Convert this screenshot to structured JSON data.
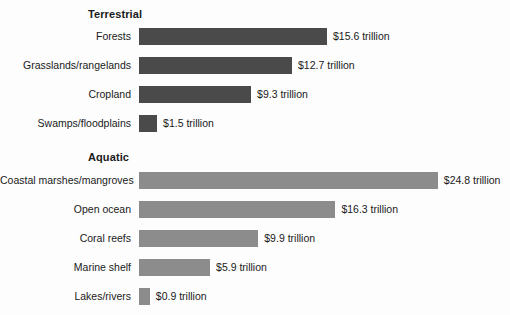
{
  "chart_data": {
    "type": "bar",
    "title": "",
    "xlabel": "",
    "ylabel": "",
    "orientation": "horizontal",
    "grid": false,
    "legend": "none",
    "value_unit": "trillion USD",
    "xlim": [
      0,
      24.8
    ],
    "groups": [
      {
        "name": "terrestrial",
        "header": "Terrestrial",
        "bar_color": "#4a4a4a",
        "categories": [
          "Forests",
          "Grasslands/rangelands",
          "Cropland",
          "Swamps/floodplains"
        ],
        "values": [
          15.6,
          12.7,
          9.3,
          1.5
        ],
        "value_labels": [
          "$15.6 trillion",
          "$12.7 trillion",
          "$9.3 trillion",
          "$1.5 trillion"
        ]
      },
      {
        "name": "aquatic",
        "header": "Aquatic",
        "bar_color": "#8c8c8c",
        "categories": [
          "Coastal marshes/mangroves",
          "Open ocean",
          "Coral reefs",
          "Marine shelf",
          "Lakes/rivers"
        ],
        "values": [
          24.8,
          16.3,
          9.9,
          5.9,
          0.9
        ],
        "value_labels": [
          "$24.8 trillion",
          "$16.3 trillion",
          "$9.9 trillion",
          "$5.9 trillion",
          "$0.9 trillion"
        ]
      }
    ]
  },
  "layout": {
    "bar_origin_x": 139,
    "px_per_trillion": 12.05,
    "bar_height": 17,
    "row_pitch": 29,
    "terrestrial_header_y": 8,
    "terrestrial_first_row_y": 28,
    "aquatic_header_y": 151,
    "aquatic_first_row_y": 172,
    "value_gap": 6,
    "background": "#fdfdfd"
  }
}
